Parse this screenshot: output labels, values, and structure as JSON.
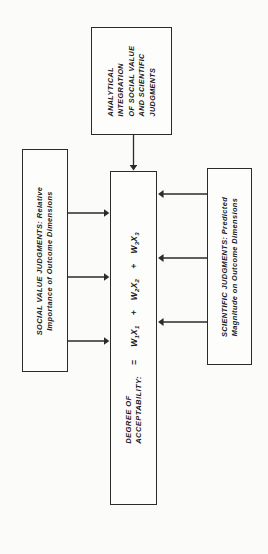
{
  "diagram": {
    "orientation": "rotated-90-ccw",
    "line_color": "#2b2b2b",
    "background_color": "#fbfbfa",
    "boxes": {
      "analytical": {
        "name": "analytical-integration-box",
        "lines": [
          "ANALYTICAL",
          "INTEGRATION",
          "OF SOCIAL VALUE",
          "AND SCIENTIFIC",
          "JUDGMENTS"
        ],
        "text": "ANALYTICAL INTEGRATION OF SOCIAL VALUE AND SCIENTIFIC JUDGMENTS"
      },
      "social": {
        "name": "social-value-judgments-box",
        "lines": [
          "SOCIAL VALUE JUDGMENTS: Relative",
          "Importance of Outcome Dimensions"
        ],
        "text": "SOCIAL VALUE JUDGMENTS: Relative Importance of Outcome Dimensions"
      },
      "scientific": {
        "name": "scientific-judgments-box",
        "lines": [
          "SCIENTIFIC JUDGMENTS: Predicted",
          "Magnitude on Outcome Dimensions"
        ],
        "text": "SCIENTIFIC JUDGMENTS: Predicted Magnitude on Outcome Dimensions"
      },
      "equation": {
        "name": "degree-of-acceptability-box",
        "label_lines": [
          "DEGREE OF",
          "ACCEPTABILITY:"
        ],
        "label": "DEGREE OF ACCEPTABILITY:",
        "equals": "=",
        "terms": [
          {
            "weight": "W",
            "weight_sub": "1",
            "magnitude": "X",
            "magnitude_sub": "1"
          },
          {
            "weight": "W",
            "weight_sub": "2",
            "magnitude": "X",
            "magnitude_sub": "2"
          },
          {
            "weight": "W",
            "weight_sub": "3",
            "magnitude": "X",
            "magnitude_sub": "3"
          }
        ],
        "operator": "+",
        "formula": "DEGREE OF ACCEPTABILITY: = W1 X1 + W2 X2 + W3 X3"
      }
    },
    "arrows": [
      {
        "name": "arrow-analytical-to-equation",
        "from": "analytical",
        "to": "equation"
      },
      {
        "name": "arrow-social-to-w1",
        "from": "social",
        "to": "equation-term-1-weight"
      },
      {
        "name": "arrow-social-to-w2",
        "from": "social",
        "to": "equation-term-2-weight"
      },
      {
        "name": "arrow-social-to-w3",
        "from": "social",
        "to": "equation-term-3-weight"
      },
      {
        "name": "arrow-scientific-to-x1",
        "from": "scientific",
        "to": "equation-term-1-magnitude"
      },
      {
        "name": "arrow-scientific-to-x2",
        "from": "scientific",
        "to": "equation-term-2-magnitude"
      },
      {
        "name": "arrow-scientific-to-x3",
        "from": "scientific",
        "to": "equation-term-3-magnitude"
      }
    ]
  }
}
